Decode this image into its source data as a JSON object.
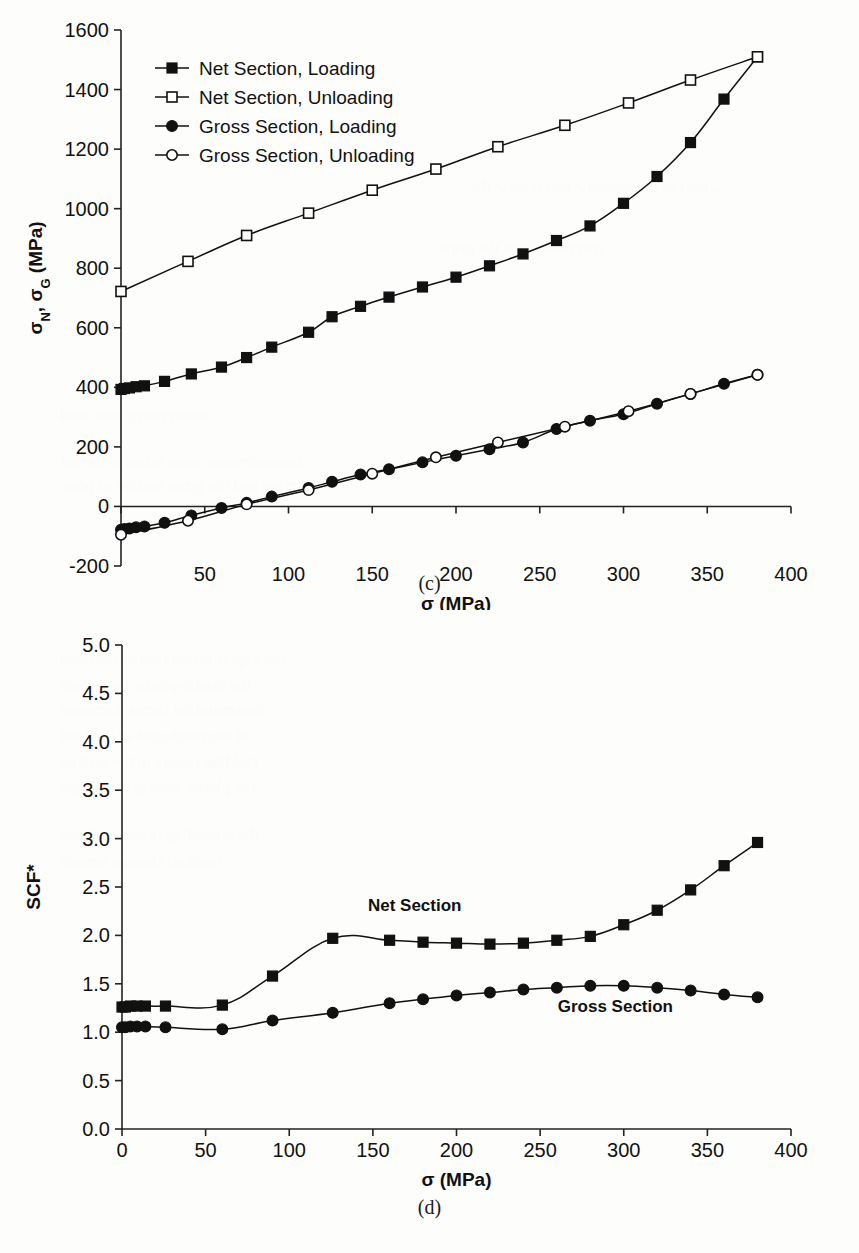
{
  "page": {
    "figure_c_caption": "(c)",
    "figure_d_caption": "(d)"
  },
  "chart_data": [
    {
      "id": "chart-c",
      "type": "line",
      "title": "",
      "caption": "(c)",
      "xlabel": "σ (MPa)",
      "ylabel": "σN, σG (MPa)",
      "ylabel_parts": {
        "sigma_n": "σN",
        "sigma_g": "σG",
        "unit": "(MPa)"
      },
      "xlim": [
        0,
        400
      ],
      "ylim": [
        -200,
        1600
      ],
      "xticks": [
        0,
        50,
        100,
        150,
        200,
        250,
        300,
        350,
        400
      ],
      "yticks": [
        -200,
        0,
        200,
        400,
        600,
        800,
        1000,
        1200,
        1400,
        1600
      ],
      "xtick_labels": [
        "0",
        "50",
        "100",
        "150",
        "200",
        "250",
        "300",
        "350",
        "400"
      ],
      "ytick_labels": [
        "-200",
        "0",
        "200",
        "400",
        "600",
        "800",
        "1000",
        "1200",
        "1400",
        "1600"
      ],
      "grid": false,
      "legend_position": "upper-left-inside",
      "series": [
        {
          "name": "Net Section, Loading",
          "marker": "filled-square",
          "points": [
            [
              0,
              393
            ],
            [
              2,
              396
            ],
            [
              5,
              398
            ],
            [
              9,
              402
            ],
            [
              14,
              405
            ],
            [
              26,
              420
            ],
            [
              42,
              445
            ],
            [
              60,
              468
            ],
            [
              75,
              500
            ],
            [
              90,
              535
            ],
            [
              112,
              585
            ],
            [
              126,
              637
            ],
            [
              143,
              672
            ],
            [
              160,
              703
            ],
            [
              180,
              737
            ],
            [
              200,
              770
            ],
            [
              220,
              808
            ],
            [
              240,
              848
            ],
            [
              260,
              893
            ],
            [
              280,
              942
            ],
            [
              300,
              1018
            ],
            [
              320,
              1108
            ],
            [
              340,
              1222
            ],
            [
              360,
              1368
            ],
            [
              380,
              1510
            ]
          ]
        },
        {
          "name": "Net Section, Unloading",
          "marker": "open-square",
          "points": [
            [
              0,
              722
            ],
            [
              40,
              823
            ],
            [
              75,
              910
            ],
            [
              112,
              985
            ],
            [
              150,
              1062
            ],
            [
              188,
              1133
            ],
            [
              225,
              1208
            ],
            [
              265,
              1280
            ],
            [
              303,
              1355
            ],
            [
              340,
              1432
            ],
            [
              380,
              1510
            ]
          ]
        },
        {
          "name": "Gross Section, Loading",
          "marker": "filled-circle",
          "points": [
            [
              0,
              -78
            ],
            [
              2,
              -76
            ],
            [
              5,
              -74
            ],
            [
              9,
              -70
            ],
            [
              14,
              -67
            ],
            [
              26,
              -55
            ],
            [
              42,
              -30
            ],
            [
              60,
              -5
            ],
            [
              75,
              12
            ],
            [
              90,
              33
            ],
            [
              112,
              62
            ],
            [
              126,
              83
            ],
            [
              143,
              107
            ],
            [
              160,
              125
            ],
            [
              180,
              148
            ],
            [
              200,
              170
            ],
            [
              220,
              192
            ],
            [
              240,
              215
            ],
            [
              260,
              260
            ],
            [
              280,
              288
            ],
            [
              300,
              310
            ],
            [
              320,
              345
            ],
            [
              340,
              378
            ],
            [
              360,
              412
            ],
            [
              380,
              442
            ]
          ]
        },
        {
          "name": "Gross Section, Unloading",
          "marker": "open-circle",
          "points": [
            [
              0,
              -95
            ],
            [
              40,
              -48
            ],
            [
              75,
              7
            ],
            [
              112,
              55
            ],
            [
              150,
              110
            ],
            [
              188,
              165
            ],
            [
              225,
              215
            ],
            [
              265,
              268
            ],
            [
              303,
              320
            ],
            [
              340,
              378
            ],
            [
              380,
              442
            ]
          ]
        }
      ]
    },
    {
      "id": "chart-d",
      "type": "line",
      "title": "",
      "caption": "(d)",
      "xlabel": "σ (MPa)",
      "ylabel": "SCF*",
      "xlim": [
        0,
        400
      ],
      "ylim": [
        0.0,
        5.0
      ],
      "xticks": [
        0,
        50,
        100,
        150,
        200,
        250,
        300,
        350,
        400
      ],
      "yticks": [
        0.0,
        0.5,
        1.0,
        1.5,
        2.0,
        2.5,
        3.0,
        3.5,
        4.0,
        4.5,
        5.0
      ],
      "xtick_labels": [
        "0",
        "50",
        "100",
        "150",
        "200",
        "250",
        "300",
        "350",
        "400"
      ],
      "ytick_labels": [
        "0.0",
        "0.5",
        "1.0",
        "1.5",
        "2.0",
        "2.5",
        "3.0",
        "3.5",
        "4.0",
        "4.5",
        "5.0"
      ],
      "grid": false,
      "legend_position": "inline-annotations",
      "annotations": [
        {
          "text": "Net Section",
          "x": 175,
          "y": 2.25
        },
        {
          "text": "Gross Section",
          "x": 295,
          "y": 1.21
        }
      ],
      "series": [
        {
          "name": "Net Section",
          "marker": "filled-square",
          "points": [
            [
              0,
              1.26
            ],
            [
              2,
              1.26
            ],
            [
              5,
              1.27
            ],
            [
              9,
              1.27
            ],
            [
              14,
              1.27
            ],
            [
              26,
              1.27
            ],
            [
              60,
              1.28
            ],
            [
              90,
              1.58
            ],
            [
              126,
              1.97
            ],
            [
              160,
              1.95
            ],
            [
              180,
              1.93
            ],
            [
              200,
              1.92
            ],
            [
              220,
              1.91
            ],
            [
              240,
              1.92
            ],
            [
              260,
              1.95
            ],
            [
              280,
              1.99
            ],
            [
              300,
              2.11
            ],
            [
              320,
              2.26
            ],
            [
              340,
              2.47
            ],
            [
              360,
              2.72
            ],
            [
              380,
              2.96
            ]
          ]
        },
        {
          "name": "Gross Section",
          "marker": "filled-circle",
          "points": [
            [
              0,
              1.05
            ],
            [
              2,
              1.05
            ],
            [
              5,
              1.06
            ],
            [
              9,
              1.06
            ],
            [
              14,
              1.06
            ],
            [
              26,
              1.05
            ],
            [
              60,
              1.03
            ],
            [
              90,
              1.12
            ],
            [
              126,
              1.2
            ],
            [
              160,
              1.3
            ],
            [
              180,
              1.34
            ],
            [
              200,
              1.38
            ],
            [
              220,
              1.41
            ],
            [
              240,
              1.44
            ],
            [
              260,
              1.46
            ],
            [
              280,
              1.48
            ],
            [
              300,
              1.48
            ],
            [
              320,
              1.46
            ],
            [
              340,
              1.43
            ],
            [
              360,
              1.39
            ],
            [
              380,
              1.36
            ]
          ]
        }
      ]
    }
  ]
}
